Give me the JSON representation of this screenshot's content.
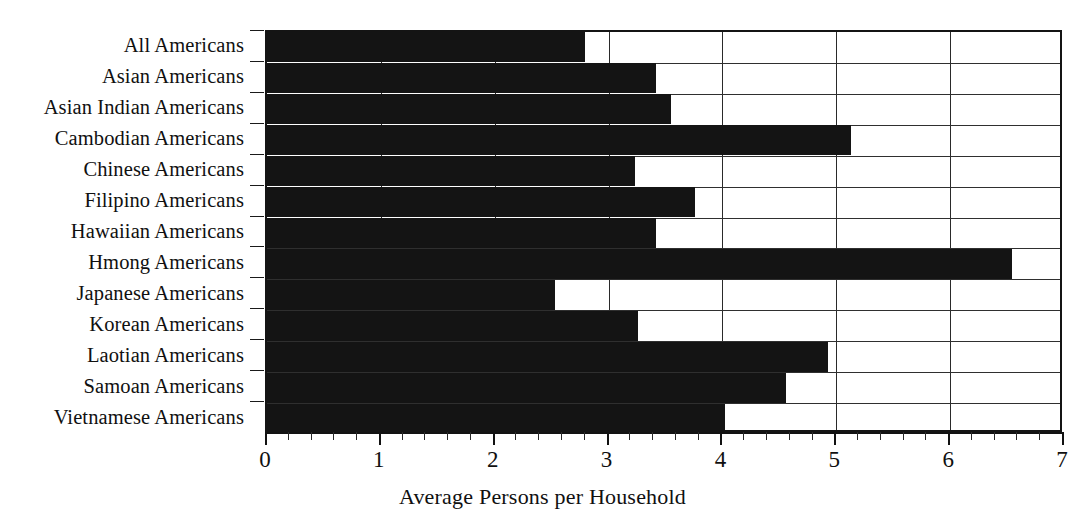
{
  "chart_data": {
    "type": "bar",
    "orientation": "horizontal",
    "title": "",
    "xlabel": "Average Persons per Household",
    "ylabel": "",
    "xlim": [
      0,
      7
    ],
    "xticks": [
      0,
      1,
      2,
      3,
      4,
      5,
      6,
      7
    ],
    "xtick_labels": [
      "0",
      "1",
      "2",
      "3",
      "4",
      "5",
      "6",
      "7"
    ],
    "minor_tick_interval": 0.2,
    "grid": "vertical-major-and-horizontal-category",
    "legend": "none",
    "bar_color": "#141414",
    "categories": [
      "All Americans",
      "Asian Americans",
      "Asian Indian Americans",
      "Cambodian Americans",
      "Chinese Americans",
      "Filipino Americans",
      "Hawaiian Americans",
      "Hmong Americans",
      "Japanese Americans",
      "Korean Americans",
      "Laotian Americans",
      "Samoan Americans",
      "Vietnamese Americans"
    ],
    "values": [
      2.79,
      3.42,
      3.55,
      5.13,
      3.23,
      3.76,
      3.42,
      6.54,
      2.53,
      3.26,
      4.93,
      4.56,
      4.02
    ]
  }
}
